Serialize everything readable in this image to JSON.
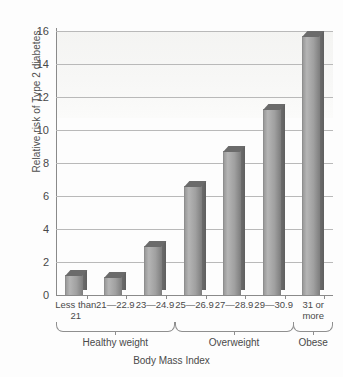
{
  "chart_data": {
    "type": "bar",
    "title": "",
    "xlabel": "Body Mass Index",
    "ylabel": "Relative risk of Type 2 diabetes",
    "categories": [
      "Less than\n21",
      "21—22.9",
      "23—24.9",
      "25—26.9",
      "27—28.9",
      "29—30.9",
      "31 or\nmore"
    ],
    "values": [
      1.2,
      1.1,
      3.0,
      6.6,
      8.7,
      11.3,
      15.7
    ],
    "ylim": [
      0,
      16
    ],
    "ytick_labels": [
      "0",
      "2",
      "4",
      "6",
      "8",
      "10",
      "12",
      "14",
      "16"
    ],
    "ytick_values": [
      0,
      2,
      4,
      6,
      8,
      10,
      12,
      14,
      16
    ],
    "grid": true,
    "legend": "none",
    "groups": [
      {
        "label": "Healthy weight",
        "first": 0,
        "last": 2
      },
      {
        "label": "Overweight",
        "first": 3,
        "last": 5
      },
      {
        "label": "Obese",
        "first": 6,
        "last": 6
      }
    ],
    "colors": {
      "bar_light": "#b5b5b5",
      "bar_dark": "#7d7d7d",
      "bar_side": "#6f6f6f",
      "grid": "#b9b9b9",
      "axis": "#8a8a8a",
      "text": "#4a4a4a",
      "background": "#fdfdfd"
    }
  }
}
